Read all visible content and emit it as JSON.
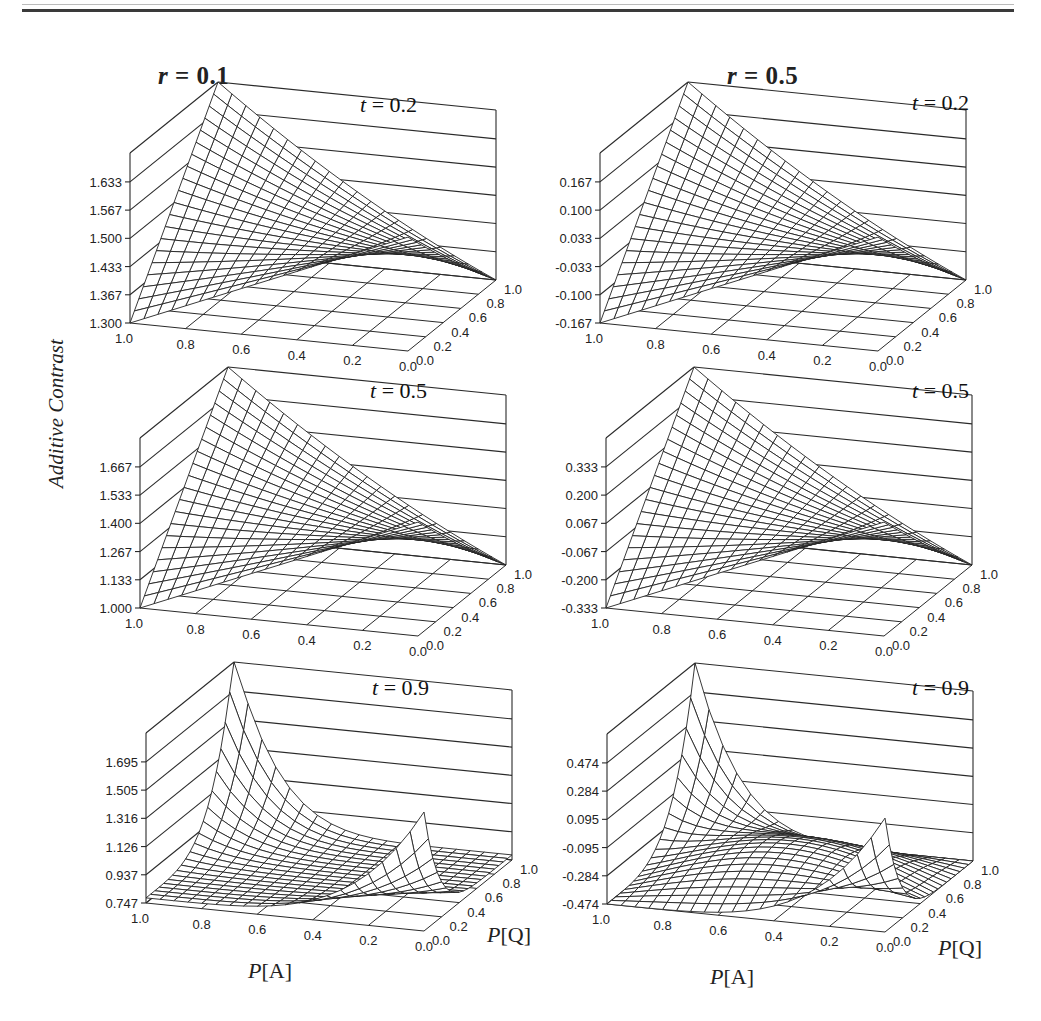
{
  "page": {
    "column_titles": [
      {
        "var": "r",
        "value": "0.1"
      },
      {
        "var": "r",
        "value": "0.5"
      }
    ],
    "y_axis_label": "Additive Contrast",
    "x_axis_label": {
      "prefix": "P",
      "name": "[A]"
    },
    "q_axis_label": {
      "prefix": "P",
      "name": "[Q]"
    }
  },
  "chart_data": [
    {
      "type": "surface3d",
      "title": "r = 0.1, t = 0.2",
      "r": 0.1,
      "t": 0.2,
      "panel_label": "t = 0.2",
      "xlabel": "P[A]",
      "ylabel": "P[Q]",
      "zlabel": "Additive Contrast",
      "x_ticks": [
        "1.0",
        "0.8",
        "0.6",
        "0.4",
        "0.2",
        "0.0"
      ],
      "y_ticks": [
        "0.0",
        "0.2",
        "0.4",
        "0.6",
        "0.8",
        "1.0"
      ],
      "z_ticks": [
        "1.300",
        "1.367",
        "1.433",
        "1.500",
        "1.567",
        "1.633"
      ],
      "zlim": [
        1.3,
        1.7
      ],
      "corners": {
        "A1_Q0": 1.3,
        "A1_Q1": 1.7,
        "A0_Q0": 1.567,
        "A0_Q1": 1.3
      },
      "shape": "saddle"
    },
    {
      "type": "surface3d",
      "title": "r = 0.5, t = 0.2",
      "r": 0.5,
      "t": 0.2,
      "panel_label": "t = 0.2",
      "xlabel": "P[A]",
      "ylabel": "P[Q]",
      "zlabel": "Additive Contrast",
      "x_ticks": [
        "1.0",
        "0.8",
        "0.6",
        "0.4",
        "0.2",
        "0.0"
      ],
      "y_ticks": [
        "0.0",
        "0.2",
        "0.4",
        "0.6",
        "0.8",
        "1.0"
      ],
      "z_ticks": [
        "-0.167",
        "-0.100",
        "-0.033",
        "0.033",
        "0.100",
        "0.167"
      ],
      "zlim": [
        -0.167,
        0.233
      ],
      "corners": {
        "A1_Q0": -0.167,
        "A1_Q1": 0.233,
        "A0_Q0": 0.1,
        "A0_Q1": -0.167
      },
      "shape": "saddle"
    },
    {
      "type": "surface3d",
      "title": "r = 0.1, t = 0.5",
      "r": 0.1,
      "t": 0.5,
      "panel_label": "t = 0.5",
      "xlabel": "P[A]",
      "ylabel": "P[Q]",
      "zlabel": "Additive Contrast",
      "x_ticks": [
        "1.0",
        "0.8",
        "0.6",
        "0.4",
        "0.2",
        "0.0"
      ],
      "y_ticks": [
        "0.0",
        "0.2",
        "0.4",
        "0.6",
        "0.8",
        "1.0"
      ],
      "z_ticks": [
        "1.000",
        "1.133",
        "1.267",
        "1.400",
        "1.533",
        "1.667"
      ],
      "zlim": [
        1.0,
        1.8
      ],
      "corners": {
        "A1_Q0": 1.0,
        "A1_Q1": 1.8,
        "A0_Q0": 1.533,
        "A0_Q1": 1.0
      },
      "shape": "saddle"
    },
    {
      "type": "surface3d",
      "title": "r = 0.5, t = 0.5",
      "r": 0.5,
      "t": 0.5,
      "panel_label": "t = 0.5",
      "xlabel": "P[A]",
      "ylabel": "P[Q]",
      "zlabel": "Additive Contrast",
      "x_ticks": [
        "1.0",
        "0.8",
        "0.6",
        "0.4",
        "0.2",
        "0.0"
      ],
      "y_ticks": [
        "0.0",
        "0.2",
        "0.4",
        "0.6",
        "0.8",
        "1.0"
      ],
      "z_ticks": [
        "-0.333",
        "-0.200",
        "-0.067",
        "0.067",
        "0.200",
        "0.333"
      ],
      "zlim": [
        -0.333,
        0.467
      ],
      "corners": {
        "A1_Q0": -0.333,
        "A1_Q1": 0.467,
        "A0_Q0": 0.2,
        "A0_Q1": -0.333
      },
      "shape": "saddle"
    },
    {
      "type": "surface3d",
      "title": "r = 0.1, t = 0.9",
      "r": 0.1,
      "t": 0.9,
      "panel_label": "t = 0.9",
      "xlabel": "P[A]",
      "ylabel": "P[Q]",
      "zlabel": "Additive Contrast",
      "x_ticks": [
        "1.0",
        "0.8",
        "0.6",
        "0.4",
        "0.2",
        "0.0"
      ],
      "y_ticks": [
        "0.0",
        "0.2",
        "0.4",
        "0.6",
        "0.8",
        "1.0"
      ],
      "z_ticks": [
        "0.747",
        "0.937",
        "1.126",
        "1.316",
        "1.505",
        "1.695"
      ],
      "zlim": [
        0.747,
        1.884
      ],
      "corners": {
        "A1_Q0": 0.747,
        "A1_Q1": 1.884,
        "A0_Q0": 1.505,
        "A0_Q1": 0.747
      },
      "shape": "sharp-saddle"
    },
    {
      "type": "surface3d",
      "title": "r = 0.5, t = 0.9",
      "r": 0.5,
      "t": 0.9,
      "panel_label": "t = 0.9",
      "xlabel": "P[A]",
      "ylabel": "P[Q]",
      "zlabel": "Additive Contrast",
      "x_ticks": [
        "1.0",
        "0.8",
        "0.6",
        "0.4",
        "0.2",
        "0.0"
      ],
      "y_ticks": [
        "0.0",
        "0.2",
        "0.4",
        "0.6",
        "0.8",
        "1.0"
      ],
      "z_ticks": [
        "-0.474",
        "-0.284",
        "-0.095",
        "0.095",
        "0.284",
        "0.474"
      ],
      "zlim": [
        -0.474,
        0.663
      ],
      "corners": {
        "A1_Q0": -0.474,
        "A1_Q1": 0.663,
        "A0_Q0": 0.284,
        "A0_Q1": -0.474
      },
      "shape": "sharp-saddle"
    }
  ]
}
